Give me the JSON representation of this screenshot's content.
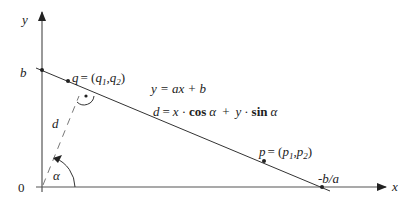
{
  "diagram": {
    "axes": {
      "x_label": "x",
      "y_label": "y",
      "origin_label": "0"
    },
    "line": {
      "equation": "y = ax + b",
      "intercept_y_label": "b",
      "intercept_x_label": "-b/a"
    },
    "normal_form": {
      "d": "d",
      "eq": "=",
      "x": "x",
      "dot1": "·",
      "cos": "cos",
      "alpha1": "α",
      "plus": "+",
      "y": "y",
      "dot2": "·",
      "sin": "sin",
      "alpha2": "α"
    },
    "points": {
      "q": {
        "name": "q",
        "eq": "= (",
        "c1": "q",
        "s1": "1",
        "comma": ",",
        "c2": "q",
        "s2": "2",
        "close": ")"
      },
      "p": {
        "name": "p",
        "eq": "= (",
        "c1": "p",
        "s1": "1",
        "comma": ",",
        "c2": "p",
        "s2": "2",
        "close": ")"
      }
    },
    "distance_label": "d",
    "angle_label": "α",
    "colors": {
      "stroke": "#333333",
      "axis": "#555555",
      "dashed": "#777777"
    }
  }
}
